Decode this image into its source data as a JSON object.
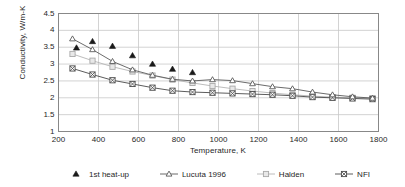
{
  "chart_data": {
    "type": "scatter",
    "title": "",
    "xlabel": "Temperature, K",
    "ylabel": "Conductivity, W/m-K",
    "xlim": [
      200,
      1800
    ],
    "ylim": [
      1,
      4.5
    ],
    "xticks": [
      200,
      400,
      600,
      800,
      1000,
      1200,
      1400,
      1600,
      1800
    ],
    "yticks": [
      1,
      1.5,
      2,
      2.5,
      3,
      3.5,
      4,
      4.5
    ],
    "grid": true,
    "legend_position": "below",
    "series": [
      {
        "name": "1st heat-up",
        "marker": "filled-triangle",
        "line": false,
        "color": "#1a1a1a",
        "x": [
          290,
          370,
          470,
          570,
          670,
          770,
          870
        ],
        "y": [
          3.48,
          3.67,
          3.53,
          3.25,
          3.0,
          2.85,
          2.75
        ]
      },
      {
        "name": "Lucuta 1996",
        "marker": "open-triangle",
        "line": true,
        "color": "#5a5a5a",
        "x": [
          270,
          370,
          470,
          570,
          670,
          770,
          870,
          970,
          1070,
          1170,
          1270,
          1370,
          1470,
          1570,
          1670,
          1770
        ],
        "y": [
          3.75,
          3.43,
          3.08,
          2.83,
          2.67,
          2.55,
          2.5,
          2.54,
          2.51,
          2.42,
          2.33,
          2.27,
          2.17,
          2.09,
          2.03,
          1.99
        ]
      },
      {
        "name": "Halden",
        "marker": "light-square",
        "line": true,
        "color": "#b4b4b4",
        "x": [
          270,
          370,
          470,
          570,
          670,
          770,
          870,
          970,
          1070,
          1170,
          1270,
          1370,
          1470,
          1570,
          1670,
          1770
        ],
        "y": [
          3.3,
          3.1,
          2.92,
          2.78,
          2.66,
          2.54,
          2.44,
          2.35,
          2.27,
          2.2,
          2.14,
          2.09,
          2.05,
          2.02,
          2.0,
          1.99
        ]
      },
      {
        "name": "NFI",
        "marker": "crossed-square",
        "line": true,
        "color": "#4a4a4a",
        "x": [
          270,
          370,
          470,
          570,
          670,
          770,
          870,
          970,
          1070,
          1170,
          1270,
          1370,
          1470,
          1570,
          1670,
          1770
        ],
        "y": [
          2.87,
          2.69,
          2.52,
          2.41,
          2.3,
          2.21,
          2.17,
          2.15,
          2.13,
          2.11,
          2.09,
          2.06,
          2.02,
          2.0,
          1.98,
          1.96
        ]
      }
    ]
  },
  "axes": {
    "xlabel": "Temperature, K",
    "ylabel": "Conductivity, W/m-K",
    "xtick_labels": [
      "200",
      "400",
      "600",
      "800",
      "1000",
      "1200",
      "1400",
      "1600",
      "1800"
    ],
    "ytick_labels": [
      "1",
      "1.5",
      "2",
      "2.5",
      "3",
      "3.5",
      "4",
      "4.5"
    ]
  },
  "legend": {
    "entries": [
      {
        "label": "1st heat-up",
        "marker": "filled-triangle"
      },
      {
        "label": "Lucuta 1996",
        "marker": "open-triangle"
      },
      {
        "label": "Halden",
        "marker": "light-square"
      },
      {
        "label": "NFI",
        "marker": "crossed-square"
      }
    ]
  },
  "colors": {
    "plot_border": "#888888",
    "gridline": "#c8c8c8",
    "text": "#1f1f1f",
    "background": "#ffffff"
  }
}
